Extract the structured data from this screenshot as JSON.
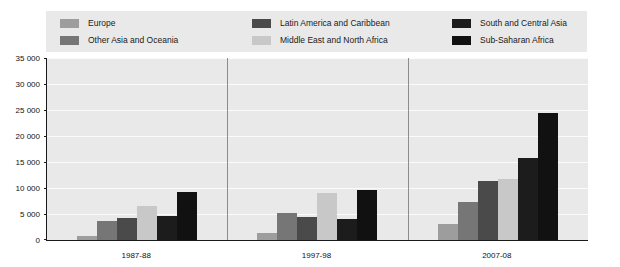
{
  "chart_data": {
    "type": "bar",
    "title": "",
    "subtitle": "",
    "xlabel": "",
    "ylabel": "",
    "categories": [
      "1987-88",
      "1997-98",
      "2007-08"
    ],
    "ylim": [
      0,
      35000
    ],
    "ytick_step": 5000,
    "ytick_labels": [
      "35 000",
      "30 000",
      "25 000",
      "20 000",
      "15 000",
      "10 000",
      "5 000",
      "0"
    ],
    "ytick_values": [
      35000,
      30000,
      25000,
      20000,
      15000,
      10000,
      5000,
      0
    ],
    "grid": true,
    "legend_position": "top",
    "series": [
      {
        "name": "Europe",
        "color": "#9d9d9d",
        "values": [
          800,
          1400,
          3000
        ]
      },
      {
        "name": "Other Asia and Oceania",
        "color": "#767676",
        "values": [
          3700,
          5100,
          7300
        ]
      },
      {
        "name": "Latin America and Caribbean",
        "color": "#4a4a4a",
        "values": [
          4300,
          4400,
          11300
        ]
      },
      {
        "name": "Middle East and North Africa",
        "color": "#c8c8c8",
        "values": [
          6500,
          9000,
          11700
        ]
      },
      {
        "name": "South and Central Asia",
        "color": "#1c1c1c",
        "values": [
          4700,
          4000,
          15700
        ]
      },
      {
        "name": "Sub-Saharan Africa",
        "color": "#111111",
        "values": [
          9300,
          9600,
          24400
        ]
      }
    ],
    "legend_columns": [
      [
        "Europe",
        "Other Asia and Oceania"
      ],
      [
        "Latin America and Caribbean",
        "Middle East and North Africa"
      ],
      [
        "South and Central Asia",
        "Sub-Saharan Africa"
      ]
    ],
    "legend_colors": {
      "Europe": "#9d9d9d",
      "Other Asia and Oceania": "#767676",
      "Latin America and Caribbean": "#4a4a4a",
      "Middle East and North Africa": "#c8c8c8",
      "South and Central Asia": "#1c1c1c",
      "Sub-Saharan Africa": "#111111"
    },
    "colors": {
      "plot_background": "#e9e9e9",
      "legend_background": "#e9e9e9",
      "gridline": "#fbfbfb",
      "axis": "#1a1a1a",
      "page_background": "#ffffff",
      "text": "#111111"
    }
  }
}
